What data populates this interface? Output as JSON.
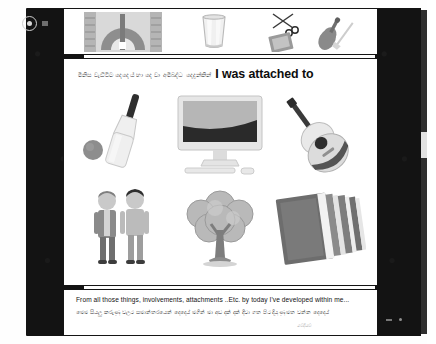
{
  "player": {
    "capture_icon": "record-circle-icon",
    "indicator_icon": "square-indicator-icon",
    "scrollbar": "vertical-scrollbar"
  },
  "filmstrip": {
    "thumbs": [
      {
        "name": "protractor-ruler-thumbnail",
        "icon": "protractor-icon"
      },
      {
        "name": "drinking-glass-thumbnail",
        "icon": "glass-tumbler-icon"
      },
      {
        "name": "scissors-book-violin-thumbnail",
        "icon": "scissors-book-violin-icon"
      }
    ]
  },
  "slide": {
    "headline_sinhala": "මිනිස වැඩිවිට දෙදෙය් හා දෙ වා අමිබද්ධ දෙදුන්කින්",
    "headline_english": "I was attached to",
    "items": [
      {
        "name": "cricket-bat-ball-image",
        "icon": "cricket-bat-icon",
        "label": "cricket"
      },
      {
        "name": "computer-image",
        "icon": "desktop-computer-icon",
        "label": "computer"
      },
      {
        "name": "guitar-image",
        "icon": "acoustic-guitar-icon",
        "label": "guitar"
      },
      {
        "name": "friends-image",
        "icon": "two-people-icon",
        "label": "friends"
      },
      {
        "name": "tree-image",
        "icon": "tree-icon",
        "label": "tree"
      },
      {
        "name": "books-image",
        "icon": "stack-of-books-icon",
        "label": "books"
      }
    ]
  },
  "caption": {
    "english": "From all those things, involvements, attachments ..Etc. by today I've  developed within  me...",
    "sinhala": "මෙම සියලු කරුණු වලට සමාන්තරයෙන් දෙදෙය් මගින් මා අඩ දක් දක් දිවා ගත පිට දියුණු මත වන්න දෙදෙය්",
    "signature": "මෙදියම"
  }
}
